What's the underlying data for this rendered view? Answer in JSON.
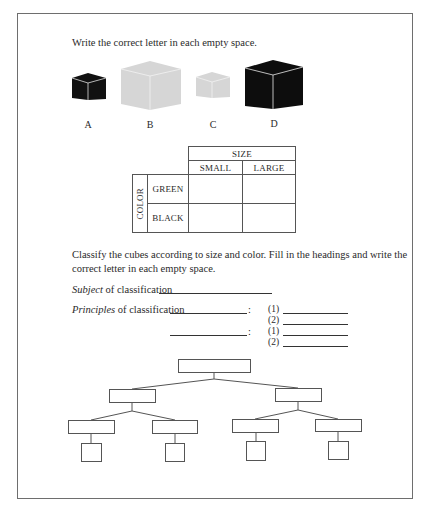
{
  "instruction_1": "Write the correct letter in each empty space.",
  "cubes": [
    {
      "label": "A",
      "color": "#111111",
      "size": "small"
    },
    {
      "label": "B",
      "color": "#d6d6d6",
      "size": "large"
    },
    {
      "label": "C",
      "color": "#d6d6d6",
      "size": "small"
    },
    {
      "label": "D",
      "color": "#0d0d0d",
      "size": "large"
    }
  ],
  "table": {
    "col_group_header": "SIZE",
    "col_headers": [
      "SMALL",
      "LARGE"
    ],
    "row_group_header": "COLOR",
    "row_headers": [
      "GREEN",
      "BLACK"
    ],
    "cells": [
      [
        "",
        ""
      ],
      [
        "",
        ""
      ]
    ]
  },
  "instruction_2_line1": "Classify the cubes according to size and color. Fill in the headings and write the",
  "instruction_2_line2": "correct letter in each empty space.",
  "form": {
    "subject_em": "Subject",
    "subject_rest": " of classification",
    "principles_em": "Principles",
    "principles_rest": " of classification",
    "colon": ":",
    "item1": "(1)",
    "item2": "(2)"
  },
  "tree": {
    "root": "",
    "level1": [
      "",
      ""
    ],
    "level2": [
      "",
      "",
      "",
      ""
    ],
    "leaves": [
      "",
      "",
      "",
      ""
    ]
  }
}
